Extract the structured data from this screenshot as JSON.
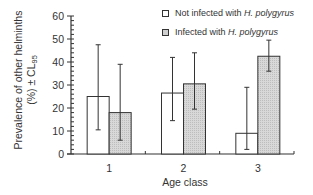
{
  "chart_data": {
    "type": "bar",
    "title": "",
    "xlabel": "Age class",
    "ylabel_line1": "Prevalence of other helminths",
    "ylabel_line2": "(%) ± CL",
    "ylabel_subscript": "95",
    "ylim": [
      0,
      60
    ],
    "yticks": [
      0,
      10,
      20,
      30,
      40,
      50,
      60
    ],
    "categories": [
      "1",
      "2",
      "3"
    ],
    "grid": false,
    "legend_position": "top-right",
    "series": [
      {
        "name_prefix": "Not infected with ",
        "name_italic": "H. polygyrus",
        "fill": "#ffffff",
        "values": [
          25,
          26.5,
          9
        ],
        "ci_lower": [
          10.5,
          14.5,
          2
        ],
        "ci_upper": [
          47.5,
          42,
          29
        ]
      },
      {
        "name_prefix": "Infected with ",
        "name_italic": "H. polygyrus",
        "fill": "#cfcfcf",
        "values": [
          18,
          30.5,
          42.5
        ],
        "ci_lower": [
          6,
          19.5,
          36
        ],
        "ci_upper": [
          39,
          44,
          49.5
        ]
      }
    ]
  }
}
